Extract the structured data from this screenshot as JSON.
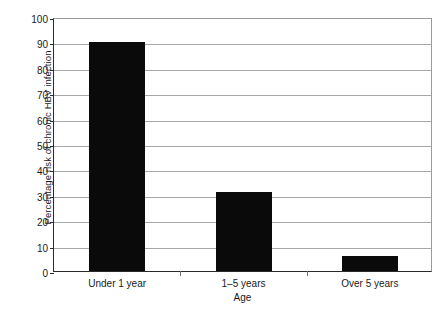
{
  "chart_data": {
    "type": "bar",
    "title": "",
    "xlabel": "Age",
    "ylabel": "Percentage risk of chronic HBV infection",
    "categories": [
      "Under 1 year",
      "1–5 years",
      "Over 5 years"
    ],
    "values": [
      90,
      31,
      6
    ],
    "ylim": [
      0,
      100
    ],
    "yticks": [
      0,
      10,
      20,
      30,
      40,
      50,
      60,
      70,
      80,
      90,
      100
    ],
    "ytick_labels": [
      "0",
      "10",
      "20",
      "30",
      "40",
      "50",
      "60",
      "70",
      "80",
      "90",
      "100"
    ],
    "grid": true,
    "legend": null,
    "bar_color": "#0a0a0a",
    "gridline_color": "#a8a8a8",
    "axis_color": "#2b2b2b",
    "background_color": "#ffffff"
  }
}
